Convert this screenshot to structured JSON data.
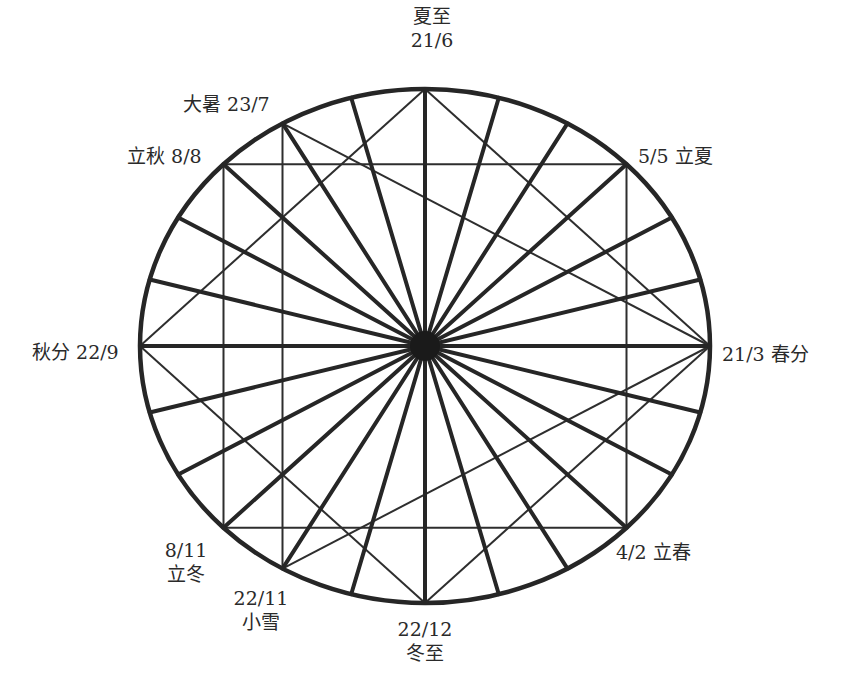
{
  "diagram": {
    "colors": {
      "line": "#262626",
      "text": "#2a2a2a",
      "background": "#ffffff"
    },
    "labels": {
      "summer_solstice": {
        "name": "夏至",
        "date": "21/6"
      },
      "major_heat": {
        "text": "大暑 23/7"
      },
      "start_autumn": {
        "text": "立秋 8/8"
      },
      "start_summer": {
        "text": "5/5 立夏"
      },
      "autumn_equinox": {
        "text": "秋分 22/9"
      },
      "spring_equinox": {
        "text": "21/3 春分"
      },
      "start_winter": {
        "date": "8/11",
        "name": "立冬"
      },
      "minor_snow": {
        "date": "22/11",
        "name": "小雪"
      },
      "winter_solstice": {
        "date": "22/12",
        "name": "冬至"
      },
      "start_spring": {
        "text": "4/2 立春"
      }
    },
    "geometry": {
      "ellipse": {
        "cx": 425,
        "cy": 346,
        "rx": 285,
        "ry": 257
      },
      "radial_count": 24,
      "radial_step_deg": 15
    }
  }
}
